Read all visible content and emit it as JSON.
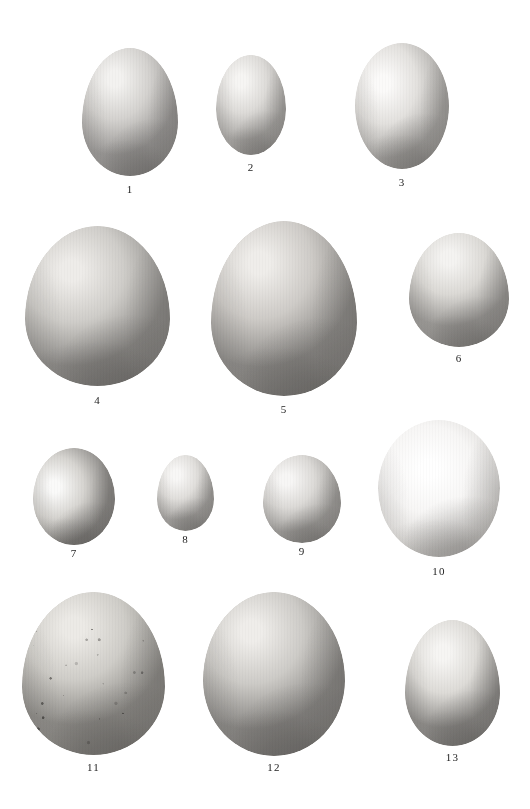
{
  "plate": {
    "title": "Comparative plate of bird eggs",
    "background_color": "#ffffff",
    "label_color": "#232323",
    "width": 530,
    "height": 809,
    "figure_count": 13,
    "rows": 4
  },
  "figures": [
    {
      "label": "1",
      "x": 82,
      "y": 48,
      "w": 96,
      "h": 128,
      "label_x": 82,
      "label_y": 184,
      "label_w": 96,
      "tone_light": "#f3f2f0",
      "tone_mid": "#d4d2cf",
      "tone_dark": "#9a9896",
      "highlight_x": "34%",
      "highlight_y": "24%",
      "shape": "ovate",
      "speckled": false,
      "row": 1
    },
    {
      "label": "2",
      "x": 216,
      "y": 55,
      "w": 70,
      "h": 100,
      "label_x": 216,
      "label_y": 162,
      "label_w": 70,
      "tone_light": "#f6f5f3",
      "tone_mid": "#dddbd8",
      "tone_dark": "#a9a7a4",
      "highlight_x": "36%",
      "highlight_y": "26%",
      "shape": "subelliptical",
      "speckled": false,
      "row": 1
    },
    {
      "label": "3",
      "x": 355,
      "y": 43,
      "w": 94,
      "h": 126,
      "label_x": 355,
      "label_y": 177,
      "label_w": 94,
      "tone_light": "#fbfaf9",
      "tone_mid": "#e3e1de",
      "tone_dark": "#a8a6a3",
      "highlight_x": "30%",
      "highlight_y": "32%",
      "shape": "elliptical",
      "speckled": false,
      "row": 1
    },
    {
      "label": "4",
      "x": 25,
      "y": 226,
      "w": 145,
      "h": 160,
      "label_x": 25,
      "label_y": 395,
      "label_w": 145,
      "tone_light": "#eeece9",
      "tone_mid": "#cfcdc9",
      "tone_dark": "#8e8c89",
      "highlight_x": "32%",
      "highlight_y": "28%",
      "shape": "ovate",
      "speckled": false,
      "row": 2
    },
    {
      "label": "5",
      "x": 211,
      "y": 221,
      "w": 146,
      "h": 175,
      "label_x": 211,
      "label_y": 404,
      "label_w": 146,
      "tone_light": "#efedea",
      "tone_mid": "#cecbc7",
      "tone_dark": "#8c8a87",
      "highlight_x": "33%",
      "highlight_y": "24%",
      "shape": "ovate",
      "speckled": false,
      "row": 2
    },
    {
      "label": "6",
      "x": 409,
      "y": 233,
      "w": 100,
      "h": 114,
      "label_x": 409,
      "label_y": 353,
      "label_w": 100,
      "tone_light": "#f4f3f1",
      "tone_mid": "#dbd9d5",
      "tone_dark": "#9b9996",
      "highlight_x": "40%",
      "highlight_y": "22%",
      "shape": "ovate",
      "speckled": false,
      "row": 2
    },
    {
      "label": "7",
      "x": 33,
      "y": 448,
      "w": 82,
      "h": 97,
      "label_x": 33,
      "label_y": 548,
      "label_w": 82,
      "tone_light": "#fafaf9",
      "tone_mid": "#d6d4d0",
      "tone_dark": "#8b8986",
      "highlight_x": "26%",
      "highlight_y": "40%",
      "shape": "rounded",
      "speckled": false,
      "row": 3
    },
    {
      "label": "8",
      "x": 157,
      "y": 455,
      "w": 57,
      "h": 76,
      "label_x": 157,
      "label_y": 534,
      "label_w": 57,
      "tone_light": "#f8f7f6",
      "tone_mid": "#e0dedb",
      "tone_dark": "#a4a29f",
      "highlight_x": "34%",
      "highlight_y": "26%",
      "shape": "ovate",
      "speckled": false,
      "row": 3
    },
    {
      "label": "9",
      "x": 263,
      "y": 455,
      "w": 78,
      "h": 88,
      "label_x": 263,
      "label_y": 546,
      "label_w": 78,
      "tone_light": "#f7f6f5",
      "tone_mid": "#dcdad7",
      "tone_dark": "#a09e9b",
      "highlight_x": "30%",
      "highlight_y": "28%",
      "shape": "subelliptical",
      "speckled": false,
      "row": 3
    },
    {
      "label": "10",
      "x": 378,
      "y": 420,
      "w": 122,
      "h": 137,
      "label_x": 378,
      "label_y": 566,
      "label_w": 122,
      "tone_light": "#ffffff",
      "tone_mid": "#f7f6f5",
      "tone_dark": "#d8d6d3",
      "highlight_x": "42%",
      "highlight_y": "36%",
      "shape": "elliptical",
      "speckled": false,
      "row": 3
    },
    {
      "label": "11",
      "x": 22,
      "y": 592,
      "w": 143,
      "h": 163,
      "label_x": 22,
      "label_y": 762,
      "label_w": 143,
      "tone_light": "#eceae6",
      "tone_mid": "#cfcdc8",
      "tone_dark": "#8d8b87",
      "highlight_x": "36%",
      "highlight_y": "22%",
      "shape": "ovate",
      "speckled": true,
      "row": 4
    },
    {
      "label": "12",
      "x": 203,
      "y": 592,
      "w": 142,
      "h": 164,
      "label_x": 203,
      "label_y": 762,
      "label_w": 142,
      "tone_light": "#efedea",
      "tone_mid": "#cdcbc7",
      "tone_dark": "#898784",
      "highlight_x": "34%",
      "highlight_y": "24%",
      "shape": "subelliptical",
      "speckled": false,
      "row": 4
    },
    {
      "label": "13",
      "x": 405,
      "y": 620,
      "w": 95,
      "h": 126,
      "label_x": 405,
      "label_y": 752,
      "label_w": 95,
      "tone_light": "#f6f5f3",
      "tone_mid": "#dddbd7",
      "tone_dark": "#8f8d8a",
      "highlight_x": "40%",
      "highlight_y": "26%",
      "shape": "ovate",
      "speckled": false,
      "row": 4
    }
  ]
}
